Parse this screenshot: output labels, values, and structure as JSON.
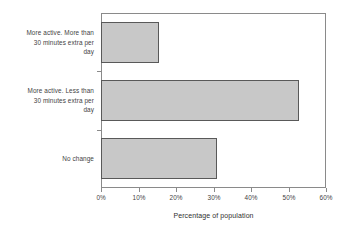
{
  "chart_data": {
    "type": "bar",
    "orientation": "horizontal",
    "title": "",
    "xlabel": "Percentage of population",
    "ylabel": "",
    "xlim": [
      0,
      60
    ],
    "xticks": [
      "0%",
      "10%",
      "20%",
      "30%",
      "40%",
      "50%",
      "60%"
    ],
    "xtick_values": [
      0,
      10,
      20,
      30,
      40,
      50,
      60
    ],
    "grid": false,
    "legend": false,
    "categories": [
      "More active. More than 30 minutes extra per day",
      "More active. Less than 30 minutes extra per day",
      "No change"
    ],
    "values": [
      15.5,
      52.8,
      31.0
    ],
    "bars": [
      {
        "label": "More active. More than 30 minutes extra per day",
        "label_lines": [
          "More active. More than",
          "30 minutes extra per",
          "day"
        ],
        "value": 15.5
      },
      {
        "label": "More active. Less than 30 minutes extra per day",
        "label_lines": [
          "More active. Less than",
          "30 minutes extra per",
          "day"
        ],
        "value": 52.8
      },
      {
        "label": "No change",
        "label_lines": [
          "No change"
        ],
        "value": 31.0
      }
    ],
    "colors": {
      "bar_fill": "#c8c8c8",
      "bar_border": "#595959",
      "axis": "#8a8a8a",
      "text": "#3f3f3f",
      "background": "#ffffff"
    }
  }
}
